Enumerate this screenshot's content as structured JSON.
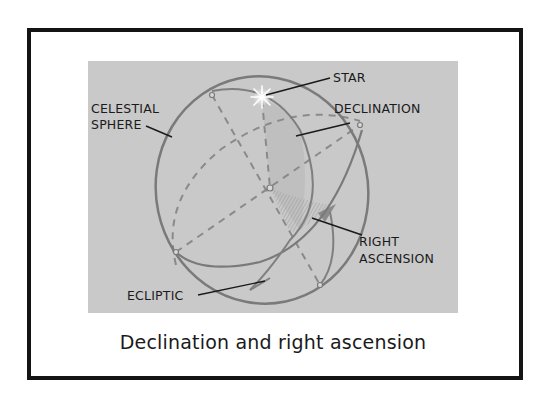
{
  "figure": {
    "caption": "Declination and right ascension",
    "labels": {
      "star": "STAR",
      "declination": "DECLINATION",
      "celestial_sphere_line1": "CELESTIAL",
      "celestial_sphere_line2": "SPHERE",
      "right_ascension_line1": "RIGHT",
      "right_ascension_line2": "ASCENSION",
      "ecliptic": "ECLIPTIC"
    },
    "colors": {
      "panel_background": "#c9c9c9",
      "sphere_outline": "#7a7a7a",
      "dashed_lines": "#8a8a8a",
      "leader_lines": "#1a1a1a",
      "star": "#ffffff",
      "frame_border": "#141414"
    }
  }
}
